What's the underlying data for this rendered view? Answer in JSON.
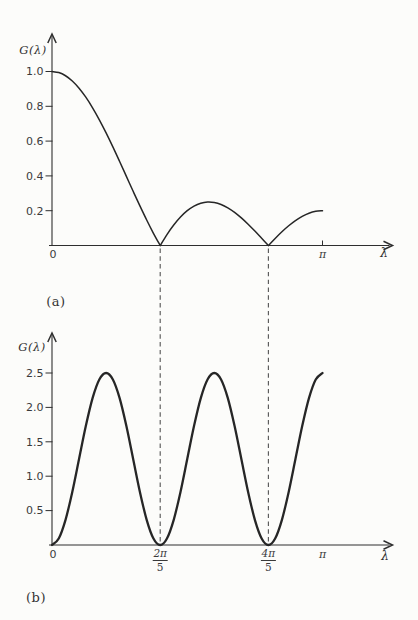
{
  "colors": {
    "paper": "#fcfcfa",
    "ink": "#2e2e2e",
    "curve": "#262626",
    "label": "#3a3a3a",
    "guide": "#5a5a5a"
  },
  "guides": {
    "dashed_x_over_pi": [
      0.4,
      0.8
    ]
  },
  "chart_data": [
    {
      "id": "a",
      "type": "line",
      "caption": "(a)",
      "ylabel": "G(λ)",
      "xlabel": "λ",
      "ylim": [
        0,
        1.12
      ],
      "x_over_pi": {
        "start": 0,
        "end": 1,
        "n": 41
      },
      "values": [
        1,
        0.9938,
        0.9755,
        0.9454,
        0.904,
        0.8524,
        0.7915,
        0.7226,
        0.6472,
        0.5668,
        0.4828,
        0.3972,
        0.3115,
        0.2274,
        0.1465,
        0.0702,
        0,
        0.063,
        0.1178,
        0.1637,
        0.2,
        0.2265,
        0.243,
        0.2498,
        0.2472,
        0.2359,
        0.2167,
        0.1906,
        0.1587,
        0.1224,
        0.0828,
        0.0416,
        0,
        0.0405,
        0.0787,
        0.1133,
        0.1432,
        0.1674,
        0.1854,
        0.1963,
        0.2
      ],
      "cusp_indices": [
        16,
        32
      ],
      "yticks": [
        {
          "v": 0.2,
          "label": "0.2"
        },
        {
          "v": 0.4,
          "label": "0.4"
        },
        {
          "v": 0.6,
          "label": "0.6"
        },
        {
          "v": 0.8,
          "label": "0.8"
        },
        {
          "v": 1.0,
          "label": "1.0"
        }
      ],
      "xticks": [
        {
          "u": 0,
          "label": "0"
        },
        {
          "u": 1,
          "label": "π",
          "tick_mark": true
        }
      ]
    },
    {
      "id": "b",
      "type": "line",
      "caption": "(b)",
      "ylabel": "G(λ)",
      "xlabel": "λ",
      "ylim": [
        0,
        2.8
      ],
      "x_over_pi": {
        "start": 0,
        "end": 1,
        "n": 41
      },
      "values": [
        0,
        0.0952,
        0.3661,
        0.7717,
        1.25,
        1.7283,
        2.1339,
        2.4048,
        2.5,
        2.4048,
        2.1339,
        1.7283,
        1.25,
        0.7717,
        0.3661,
        0.0952,
        0,
        0.0952,
        0.3661,
        0.7717,
        1.25,
        1.7283,
        2.1339,
        2.4048,
        2.5,
        2.4048,
        2.1339,
        1.7283,
        1.25,
        0.7717,
        0.3661,
        0.0952,
        0,
        0.0952,
        0.3661,
        0.7717,
        1.25,
        1.7283,
        2.1339,
        2.4048,
        2.5
      ],
      "cusp_indices": [],
      "yticks": [
        {
          "v": 0.5,
          "label": "0.5"
        },
        {
          "v": 1.0,
          "label": "1.0"
        },
        {
          "v": 1.5,
          "label": "1.5"
        },
        {
          "v": 2.0,
          "label": "2.0"
        },
        {
          "v": 2.5,
          "label": "2.5"
        }
      ],
      "xticks": [
        {
          "u": 0,
          "label": "0"
        },
        {
          "u": 0.4,
          "frac": [
            "2π",
            "5"
          ]
        },
        {
          "u": 0.8,
          "frac": [
            "4π",
            "5"
          ]
        },
        {
          "u": 1,
          "label": "π"
        }
      ]
    }
  ]
}
